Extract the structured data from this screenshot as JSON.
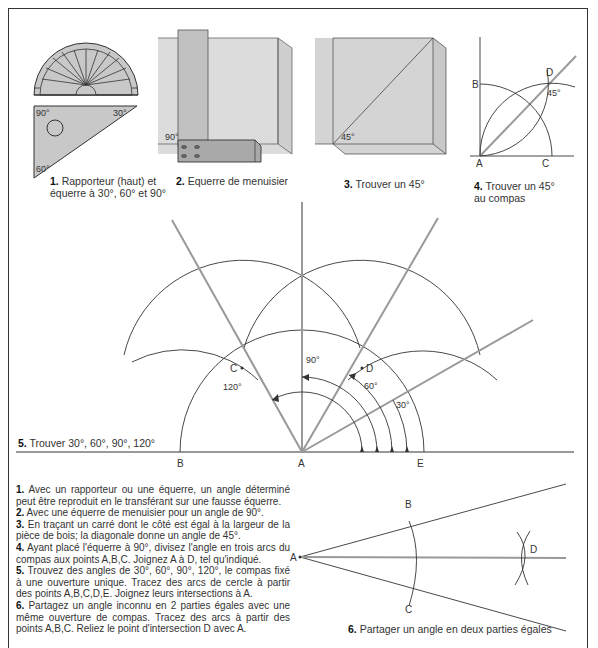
{
  "page_title": "Comment tracer des angles",
  "figures": [
    {
      "number": "1.",
      "caption": "Rapporteur (haut) et équerre à 30°, 60° et 90°",
      "labels": [
        "90°",
        "30°",
        "60°"
      ]
    },
    {
      "number": "2.",
      "caption": "Equerre de menuisier",
      "labels": [
        "90°"
      ]
    },
    {
      "number": "3.",
      "caption": "Trouver un 45°",
      "labels": [
        "45°"
      ]
    },
    {
      "number": "4.",
      "caption": "Trouver un 45° au compas",
      "labels": [
        "B",
        "D",
        "45°",
        "A",
        "C"
      ]
    },
    {
      "number": "5.",
      "caption": "Trouver 30°, 60°, 90°, 120°",
      "labels": [
        "C",
        "D",
        "90°",
        "120°",
        "60°",
        "30°",
        "B",
        "A",
        "E"
      ]
    },
    {
      "number": "6.",
      "caption": "Partager un angle en deux parties égales",
      "labels": [
        "A",
        "B",
        "C",
        "D"
      ]
    }
  ],
  "fig1": {
    "num": "1.",
    "line1": "Rapporteur (haut) et",
    "line2": "équerre à 30°, 60° et 90°",
    "a90": "90°",
    "a30": "30°",
    "a60": "60°"
  },
  "fig2": {
    "num": "2.",
    "text": "Equerre de menuisier",
    "a90": "90°"
  },
  "fig3": {
    "num": "3.",
    "text": "Trouver un 45°",
    "a45": "45°"
  },
  "fig4": {
    "num": "4.",
    "line1": "Trouver un 45°",
    "line2": "au compas",
    "B": "B",
    "D": "D",
    "A": "A",
    "C": "C",
    "a45": "45°"
  },
  "fig5": {
    "num": "5.",
    "text": "Trouver 30°, 60°, 90°, 120°",
    "C": "C",
    "D": "D",
    "B": "B",
    "A": "A",
    "E": "E",
    "a90": "90°",
    "a120": "120°",
    "a60": "60°",
    "a30": "30°"
  },
  "fig6": {
    "num": "6.",
    "text": "Partager un angle en deux parties égales",
    "A": "A",
    "B": "B",
    "C": "C",
    "D": "D"
  },
  "instructions": [
    {
      "num": "1.",
      "text": "Avec un rapporteur ou une équerre, un angle déterminé peut être reproduit en le transférant sur une fausse équerre."
    },
    {
      "num": "2.",
      "text": "Avec une équerre de menuisier pour un angle de 90°."
    },
    {
      "num": "3.",
      "text": "En traçant un carré dont le côté est égal à la largeur de la pièce de bois; la diagonale donne un angle de 45°."
    },
    {
      "num": "4.",
      "text": "Ayant placé l'équerre à 90°, divisez l'angle en trois arcs du compas aux points A,B,C. Joignez A à D, tel qu'indiqué."
    },
    {
      "num": "5.",
      "text": "Trouvez des angles de 30°, 60°, 90°, 120°, le compas fixé à une ouverture unique. Tracez des arcs de cercle à partir des points A,B,C,D,E. Joignez leurs intersections à A."
    },
    {
      "num": "6.",
      "text": "Partagez un angle inconnu en 2 parties égales avec une même ouverture de compas. Tracez des arcs à partir des points A,B,C. Reliez le point d'intersection D avec A."
    }
  ]
}
